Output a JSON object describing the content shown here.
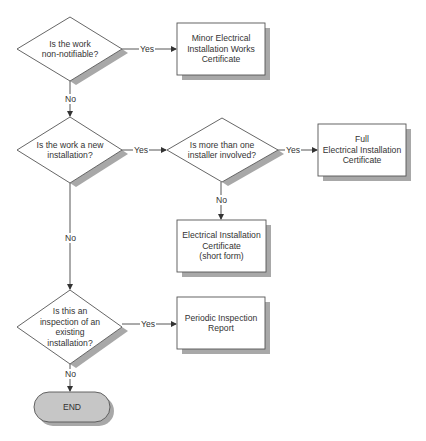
{
  "colors": {
    "stroke": "#555555",
    "fill": "#ffffff",
    "shadow": "#a8a8a8",
    "terminal_fill": "#c6c6c6",
    "text": "#333333"
  },
  "nodes": {
    "q_non_notifiable": {
      "type": "decision",
      "label": "Is the work non-notifiable?",
      "lines": [
        "Is the work",
        "non-notifiable?"
      ]
    },
    "minor_cert": {
      "type": "process",
      "label": "Minor Electrical Installation Works Certificate",
      "lines": [
        "Minor Electrical",
        "Installation Works",
        "Certificate"
      ]
    },
    "q_new_installation": {
      "type": "decision",
      "label": "Is the work a new installation?",
      "lines": [
        "Is the work a new",
        "installation?"
      ]
    },
    "q_multi_installer": {
      "type": "decision",
      "label": "Is more than one installer involved?",
      "lines": [
        "Is more than one",
        "installer involved?"
      ]
    },
    "full_cert": {
      "type": "process",
      "label": "Full Electrical Installation Certificate",
      "lines": [
        "Full",
        "Electrical Installation",
        "Certificate"
      ]
    },
    "short_cert": {
      "type": "process",
      "label": "Electrical Installation Certificate (short form)",
      "lines": [
        "Electrical Installation",
        "Certificate",
        "(short form)"
      ]
    },
    "q_inspection": {
      "type": "decision",
      "label": "Is this an inspection of an existing installation?",
      "lines": [
        "Is this an",
        "inspection of an",
        "existing",
        "installation?"
      ]
    },
    "periodic_report": {
      "type": "process",
      "label": "Periodic Inspection Report",
      "lines": [
        "Periodic Inspection",
        "Report"
      ]
    },
    "end": {
      "type": "terminal",
      "label": "END"
    }
  },
  "edges": [
    {
      "from": "q_non_notifiable",
      "to": "minor_cert",
      "label": "Yes"
    },
    {
      "from": "q_non_notifiable",
      "to": "q_new_installation",
      "label": "No"
    },
    {
      "from": "q_new_installation",
      "to": "q_multi_installer",
      "label": "Yes"
    },
    {
      "from": "q_multi_installer",
      "to": "full_cert",
      "label": "Yes"
    },
    {
      "from": "q_multi_installer",
      "to": "short_cert",
      "label": "No"
    },
    {
      "from": "q_new_installation",
      "to": "q_inspection",
      "label": "No"
    },
    {
      "from": "q_inspection",
      "to": "periodic_report",
      "label": "Yes"
    },
    {
      "from": "q_inspection",
      "to": "end",
      "label": "No"
    }
  ]
}
